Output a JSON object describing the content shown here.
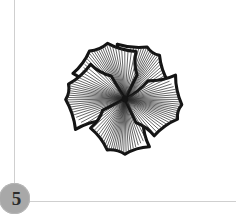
{
  "page": {
    "background_color": "#ffffff",
    "width": 236,
    "height": 214
  },
  "rules": {
    "vertical_color": "#cfcfcf",
    "horizontal_color": "#cfcfcf"
  },
  "step_badge": {
    "label": "5",
    "fill_color": "#a8a8a8",
    "text_color": "#2b2b2b"
  },
  "illustration": {
    "name": "five-petal-flower-line-drawing",
    "outline_color": "#141414",
    "hatch_color": "#2a2a2a",
    "fill_color": "#ffffff",
    "petal_count": 5,
    "center_x": 70,
    "center_y": 66,
    "petals": [
      {
        "name": "petal-upper-right",
        "angle_deg": -54,
        "tip_x": 96,
        "tip_y": 16,
        "hatch_lines": 30
      },
      {
        "name": "petal-upper-left",
        "angle_deg": -126,
        "tip_x": 42,
        "tip_y": 14,
        "hatch_lines": 30
      },
      {
        "name": "petal-left",
        "angle_deg": 178,
        "tip_x": 11,
        "tip_y": 62,
        "hatch_lines": 30
      },
      {
        "name": "petal-bottom",
        "angle_deg": 104,
        "tip_x": 62,
        "tip_y": 120,
        "hatch_lines": 30
      },
      {
        "name": "petal-right",
        "angle_deg": 30,
        "tip_x": 126,
        "tip_y": 76,
        "hatch_lines": 30
      }
    ]
  }
}
